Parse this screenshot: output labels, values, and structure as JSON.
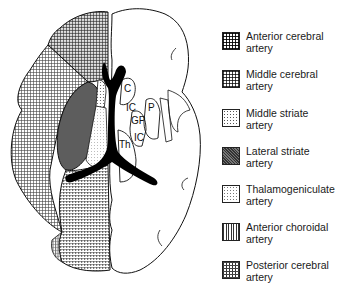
{
  "diagram": {
    "structure_labels": [
      {
        "id": "C",
        "text": "C",
        "meaning": "caudate"
      },
      {
        "id": "IC1",
        "text": "IC",
        "meaning": "internal capsule (anterior)"
      },
      {
        "id": "P",
        "text": "P",
        "meaning": "putamen"
      },
      {
        "id": "GP",
        "text": "GP",
        "meaning": "globus pallidus"
      },
      {
        "id": "Th",
        "text": "Th",
        "meaning": "thalamus"
      },
      {
        "id": "IC2",
        "text": "IC",
        "meaning": "internal capsule (posterior)"
      }
    ]
  },
  "legend": {
    "items": [
      {
        "line1": "Anterior cerebral",
        "line2": "artery",
        "pattern": "dense-dot-grid"
      },
      {
        "line1": "Middle cerebral",
        "line2": "artery",
        "pattern": "fine-grid"
      },
      {
        "line1": "Middle striate",
        "line2": "artery",
        "pattern": "dots"
      },
      {
        "line1": "Lateral striate",
        "line2": "artery",
        "pattern": "dark-crosshatch"
      },
      {
        "line1": "Thalamogeniculate",
        "line2": "artery",
        "pattern": "sparse-dots"
      },
      {
        "line1": "Anterior choroidal",
        "line2": "artery",
        "pattern": "vertical-lines"
      },
      {
        "line1": "Posterior cerebral",
        "line2": "artery",
        "pattern": "vertical-dashes"
      }
    ]
  },
  "colors": {
    "ink": "#111111",
    "background": "#ffffff"
  }
}
